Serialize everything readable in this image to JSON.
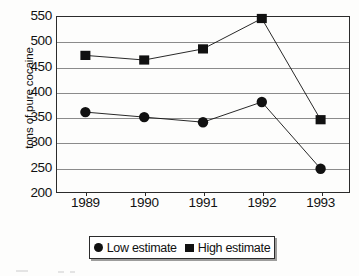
{
  "chart_data": {
    "type": "line",
    "title": "",
    "xlabel": "",
    "ylabel": "tons of pure cocaine",
    "categories": [
      "1989",
      "1990",
      "1991",
      "1992",
      "1993"
    ],
    "ylim": [
      200,
      550
    ],
    "yticks": [
      200,
      250,
      300,
      350,
      400,
      450,
      500,
      550
    ],
    "ytick_labels": [
      "200",
      "250",
      "300",
      "350",
      "400",
      "450",
      "500",
      "550"
    ],
    "grid": "horizontal",
    "legend_position": "bottom",
    "series": [
      {
        "name": "Low estimate",
        "marker": "circle",
        "color": "#111111",
        "values": [
          360,
          350,
          340,
          380,
          248
        ]
      },
      {
        "name": "High estimate",
        "marker": "square",
        "color": "#111111",
        "values": [
          472,
          463,
          485,
          545,
          345
        ]
      }
    ]
  },
  "legend": {
    "entries": [
      {
        "label": "Low estimate",
        "marker": "circle-marker-icon"
      },
      {
        "label": "High estimate",
        "marker": "square-marker-icon"
      }
    ]
  },
  "axes": {
    "y_title": "tons of pure cocaine",
    "y_tick_labels": [
      "550",
      "500",
      "450",
      "400",
      "350",
      "300",
      "250",
      "200"
    ],
    "x_tick_labels": [
      "1989",
      "1990",
      "1991",
      "1992",
      "1993"
    ]
  },
  "colors": {
    "marker": "#111111",
    "gridline": "#8b8b8b",
    "frame": "#2b2b2b",
    "background": "#fdfdfc"
  }
}
